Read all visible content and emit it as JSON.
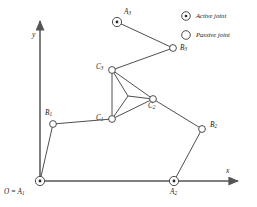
{
  "figure": {
    "type": "kinematic-diagram",
    "stroke_color": "#3a3a3a",
    "axis_color": "#555555",
    "label_color": "#1a1a1a"
  },
  "axes": {
    "x_label": "x",
    "y_label": "y",
    "origin_label_main": "O = A",
    "origin_label_sub": "1"
  },
  "legend": {
    "items": [
      {
        "marker": "active-joint-icon",
        "label": "Active joint"
      },
      {
        "marker": "passive-joint-icon",
        "label": "Passive joint"
      }
    ]
  },
  "joints": {
    "A1": {
      "label": "A",
      "sub": "1",
      "type": "active",
      "x": 40,
      "y": 181
    },
    "A2": {
      "label": "A",
      "sub": "2",
      "type": "active",
      "x": 174,
      "y": 181
    },
    "A3": {
      "label": "A",
      "sub": "3",
      "type": "active",
      "x": 117,
      "y": 22
    },
    "B1": {
      "label": "B",
      "sub": "1",
      "type": "passive",
      "x": 53,
      "y": 124
    },
    "B2": {
      "label": "B",
      "sub": "2",
      "type": "passive",
      "x": 202,
      "y": 129
    },
    "B3": {
      "label": "B",
      "sub": "3",
      "type": "passive",
      "x": 173,
      "y": 48
    },
    "C1": {
      "label": "C",
      "sub": "1",
      "type": "passive",
      "x": 112,
      "y": 119
    },
    "C2": {
      "label": "C",
      "sub": "2",
      "type": "passive",
      "x": 153,
      "y": 99
    },
    "C3": {
      "label": "C",
      "sub": "3",
      "type": "passive",
      "x": 112,
      "y": 70
    }
  },
  "platform": {
    "center": {
      "x": 128,
      "y": 96
    },
    "vertices": [
      "C3",
      "C2",
      "C1"
    ]
  },
  "links": [
    {
      "from": "A1",
      "to": "B1"
    },
    {
      "from": "B1",
      "to": "C1"
    },
    {
      "from": "A2",
      "to": "B2"
    },
    {
      "from": "B2",
      "to": "C2"
    },
    {
      "from": "A3",
      "to": "B3"
    },
    {
      "from": "B3",
      "to": "C3"
    }
  ]
}
